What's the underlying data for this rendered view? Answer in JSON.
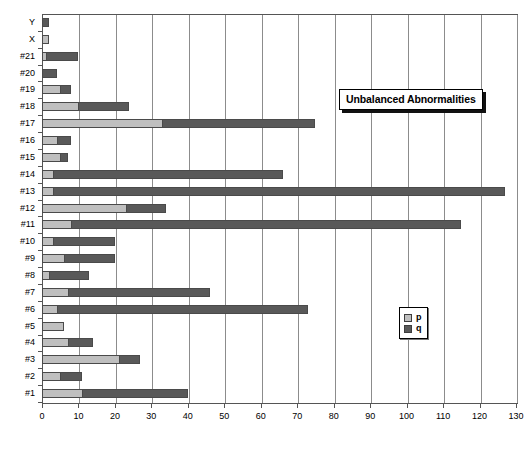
{
  "chart_data": {
    "type": "bar",
    "orientation": "horizontal",
    "stacked": true,
    "title": "Unbalanced Abnormalities",
    "xlabel": "",
    "ylabel": "",
    "xlim": [
      0,
      130
    ],
    "xticks": [
      0,
      10,
      20,
      30,
      40,
      50,
      60,
      70,
      80,
      90,
      100,
      110,
      120,
      130
    ],
    "grid": true,
    "grid_axis": "x",
    "legend_position": "inside-right",
    "categories": [
      "#1",
      "#2",
      "#3",
      "#4",
      "#5",
      "#6",
      "#7",
      "#8",
      "#9",
      "#10",
      "#11",
      "#12",
      "#13",
      "#14",
      "#15",
      "#16",
      "#17",
      "#18",
      "#19",
      "#20",
      "#21",
      "X",
      "Y"
    ],
    "series": [
      {
        "name": "p",
        "color": "#bfbfbf",
        "values": [
          11,
          5,
          21,
          7,
          6,
          4,
          7,
          2,
          6,
          3,
          8,
          23,
          3,
          3,
          5,
          4,
          33,
          10,
          5,
          0,
          1,
          2,
          0
        ]
      },
      {
        "name": "q",
        "color": "#595959",
        "values": [
          29,
          6,
          6,
          7,
          0,
          69,
          39,
          11,
          14,
          17,
          107,
          11,
          124,
          63,
          2,
          4,
          42,
          14,
          3,
          4,
          9,
          0,
          2
        ]
      }
    ],
    "totals": [
      40,
      11,
      27,
      14,
      6,
      73,
      46,
      13,
      20,
      20,
      115,
      34,
      127,
      66,
      7,
      8,
      75,
      24,
      8,
      4,
      10,
      2,
      2
    ]
  },
  "legend": {
    "items": [
      {
        "label": "p",
        "color": "#bfbfbf"
      },
      {
        "label": "q",
        "color": "#595959"
      }
    ]
  }
}
